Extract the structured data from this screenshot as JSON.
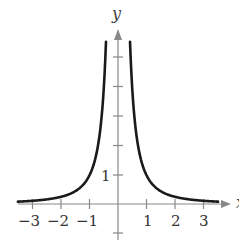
{
  "chart_data": {
    "type": "line",
    "title": "",
    "function": "y = 1/x^2",
    "xlabel": "x",
    "ylabel": "y",
    "xlim": [
      -3.5,
      3.7
    ],
    "ylim": [
      -1.2,
      6.0
    ],
    "grid": false,
    "legend": null,
    "x_ticks": [
      -3,
      -2,
      -1,
      1,
      2,
      3
    ],
    "x_tick_labels": [
      "−3",
      "−2",
      "−1",
      "1",
      "2",
      "3"
    ],
    "y_ticks": [
      -1,
      1,
      2,
      3,
      4,
      5
    ],
    "y_tick_labels": [
      "1"
    ],
    "series": [
      {
        "name": "left branch",
        "x": [
          -3.4,
          -3,
          -2.5,
          -2,
          -1.5,
          -1,
          -0.8,
          -0.6,
          -0.5,
          -0.42
        ],
        "y": [
          0.087,
          0.111,
          0.16,
          0.25,
          0.444,
          1.0,
          1.5625,
          2.778,
          4.0,
          5.67
        ]
      },
      {
        "name": "right branch",
        "x": [
          0.42,
          0.5,
          0.6,
          0.8,
          1,
          1.5,
          2,
          2.5,
          3,
          3.4
        ],
        "y": [
          5.67,
          4.0,
          2.778,
          1.5625,
          1.0,
          0.444,
          0.25,
          0.16,
          0.111,
          0.087
        ]
      }
    ],
    "color": "#1a1a1a",
    "axis_color": "#777777"
  },
  "labels": {
    "x_axis": "x",
    "y_axis": "y",
    "x_ticks": [
      "−3",
      "−2",
      "−1",
      "1",
      "2",
      "3"
    ],
    "y_one": "1"
  }
}
